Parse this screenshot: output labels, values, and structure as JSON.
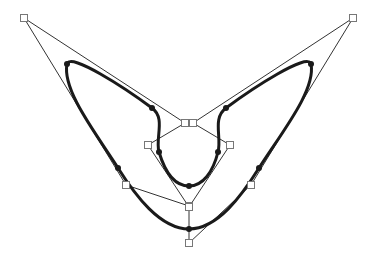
{
  "diagram": {
    "type": "b-spline-with-control-polygon",
    "colors": {
      "background": "#ffffff",
      "control_polygon": "#333333",
      "curve": "#1a1a1a",
      "control_point_fill": "#ffffff",
      "control_point_stroke": "#777777",
      "knot": "#1a1a1a"
    },
    "control_points": [
      [
        189,
        206
      ],
      [
        126,
        185
      ],
      [
        24,
        18
      ],
      [
        185,
        123
      ],
      [
        148,
        145
      ],
      [
        189,
        207
      ],
      [
        230,
        145
      ],
      [
        193,
        123
      ],
      [
        353,
        18
      ],
      [
        251,
        185
      ],
      [
        189,
        243
      ]
    ],
    "control_polygon_closed": true,
    "knot_points": [
      [
        189,
        229
      ],
      [
        118,
        168
      ],
      [
        67,
        64
      ],
      [
        152,
        108
      ],
      [
        159,
        152
      ],
      [
        189,
        186
      ],
      [
        218,
        152
      ],
      [
        226,
        108
      ],
      [
        311,
        64
      ],
      [
        259,
        168
      ]
    ],
    "curve_path": "M189,229 C160,229 135,195 118,168 C95,132 62,90 67,64 C70,52 125,88 152,108 C166,118 155,138 159,152 C165,172 175,186 189,186 C203,186 213,172 218,152 C222,138 212,118 226,108 C253,88 308,52 311,64 C316,90 282,132 259,168 C242,195 218,229 189,229 Z"
  }
}
